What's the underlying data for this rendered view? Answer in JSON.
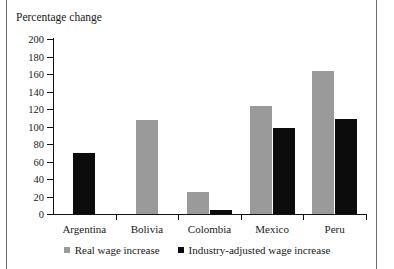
{
  "chart_data": {
    "type": "bar",
    "title": "Percentage change",
    "xlabel": "",
    "ylabel": "Percentage change",
    "categories": [
      "Argentina",
      "Bolivia",
      "Colombia",
      "Mexico",
      "Peru"
    ],
    "series": [
      {
        "name": "Real wage increase",
        "color": "#9a9a9a",
        "values": [
          null,
          107,
          25,
          123,
          163
        ]
      },
      {
        "name": "Industry-adjusted wage increase",
        "color": "#0c0c0c",
        "values": [
          70,
          null,
          5,
          98,
          109
        ]
      }
    ],
    "ylim": [
      0,
      200
    ],
    "yticks": [
      0,
      20,
      40,
      60,
      80,
      100,
      120,
      140,
      160,
      180,
      200
    ],
    "ytick_labels": [
      "0",
      "20",
      "40",
      "60",
      "80",
      "100",
      "120",
      "140",
      "160",
      "180",
      "200"
    ],
    "grid": false,
    "legend_position": "bottom"
  },
  "legend": {
    "items": [
      {
        "label": "Real wage increase"
      },
      {
        "label": "Industry-adjusted wage increase"
      }
    ]
  }
}
